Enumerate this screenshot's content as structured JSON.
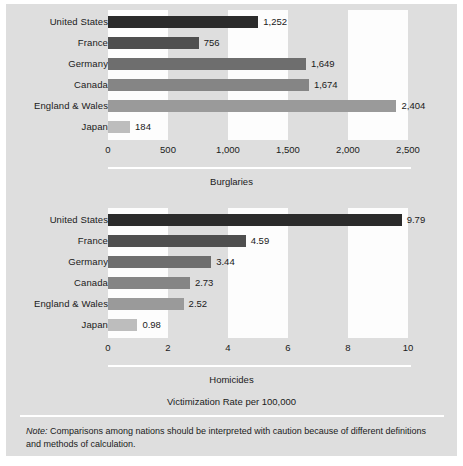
{
  "figure": {
    "background_color": "#dedede",
    "band_color": "#fdfdfd",
    "rule_color": "#ffffff",
    "note_prefix": "Note:",
    "note_text": " Comparisons among nations should be interpreted with caution because of different definitions and methods of calculation.",
    "axis_caption": "Victimization Rate per 100,000"
  },
  "chart_data": [
    {
      "type": "bar",
      "orientation": "horizontal",
      "title": "Burglaries",
      "xlabel": "",
      "ylabel": "",
      "xlim": [
        0,
        2500
      ],
      "grid": false,
      "bands": true,
      "categories": [
        "United States",
        "France",
        "Germany",
        "Canada",
        "England & Wales",
        "Japan"
      ],
      "values": [
        1252,
        756,
        1649,
        1674,
        2404,
        184
      ],
      "value_labels": [
        "1,252",
        "756",
        "1,649",
        "1,674",
        "2,404",
        "184"
      ],
      "bar_colors": [
        "#2b2b2b",
        "#4f4f4f",
        "#6e6e6e",
        "#858585",
        "#9a9a9a",
        "#bdbdbd"
      ],
      "ticks": [
        0,
        500,
        1000,
        1500,
        2000,
        2500
      ],
      "tick_labels": [
        "0",
        "500",
        "1,000",
        "1,500",
        "2,000",
        "2,500"
      ]
    },
    {
      "type": "bar",
      "orientation": "horizontal",
      "title": "Homicides",
      "xlabel": "",
      "ylabel": "",
      "xlim": [
        0,
        10
      ],
      "grid": false,
      "bands": true,
      "categories": [
        "United States",
        "France",
        "Germany",
        "Canada",
        "England & Wales",
        "Japan"
      ],
      "values": [
        9.79,
        4.59,
        3.44,
        2.73,
        2.52,
        0.98
      ],
      "value_labels": [
        "9.79",
        "4.59",
        "3.44",
        "2.73",
        "2.52",
        "0.98"
      ],
      "bar_colors": [
        "#2b2b2b",
        "#4f4f4f",
        "#6e6e6e",
        "#858585",
        "#9a9a9a",
        "#bdbdbd"
      ],
      "ticks": [
        0,
        2,
        4,
        6,
        8,
        10
      ],
      "tick_labels": [
        "0",
        "2",
        "4",
        "6",
        "8",
        "10"
      ]
    }
  ]
}
